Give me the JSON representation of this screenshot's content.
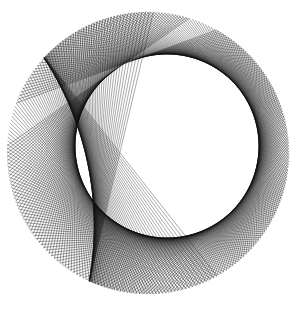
{
  "caption_fragment": "",
  "figure": {
    "canvas": {
      "width": 299,
      "height": 309,
      "background": "#ffffff"
    },
    "stroke_color": "#111111",
    "stroke_width": 0.45,
    "outer_circle": {
      "cx": 148,
      "cy": 153,
      "r": 141
    },
    "inner_envelope": {
      "cx": 167,
      "cy": 146,
      "r": 92
    },
    "ring_lines": {
      "count": 260,
      "start_deg": -110,
      "end_deg": 235
    },
    "fold_lines": {
      "count": 70,
      "anchor_top": [
        72,
        92
      ],
      "anchor_bottom": [
        102,
        228
      ]
    }
  }
}
